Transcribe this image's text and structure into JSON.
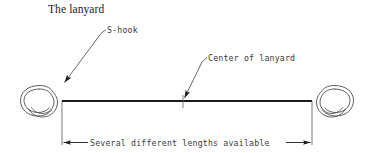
{
  "title": "The lanyard",
  "diagram": {
    "type": "technical-line-drawing",
    "labels": {
      "s_hook": "S-hook",
      "center_of_lanyard": "Center of lanyard",
      "dimension": "Several different lengths available"
    },
    "colors": {
      "line": "#1a1a1a",
      "thin_line": "#555555",
      "text": "#3a3a3a",
      "title_text": "#1a1a1a",
      "background": "#ffffff"
    },
    "components": [
      {
        "name": "left-s-hook",
        "description": "S-shaped wire hook at left end of lanyard"
      },
      {
        "name": "lanyard-cord",
        "description": "horizontal cord spanning between the two S-hooks"
      },
      {
        "name": "right-s-hook",
        "description": "S-shaped wire hook at right end of lanyard"
      },
      {
        "name": "center-marker",
        "description": "tick mark at the midpoint of the lanyard cord"
      },
      {
        "name": "dimension-line",
        "description": "double-arrow dimension line measuring hook-to-hook length"
      }
    ]
  }
}
